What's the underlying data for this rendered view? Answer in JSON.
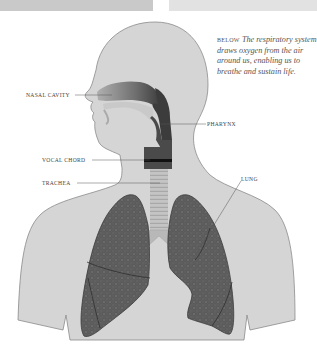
{
  "figure": {
    "title": "Respiratory system",
    "caption": {
      "lead": "BELOW",
      "body": "The respiratory system draws oxygen from the air around us, enabling us to breathe and sustain life."
    },
    "labels": {
      "nasal_cavity": "NASAL CAVITY",
      "pharynx": "PHARYNX",
      "vocal_chord": "VOCAL CHORD",
      "trachea": "TRACHEA",
      "lung": "LUNG"
    },
    "colors": {
      "body": "#d4d4d4",
      "outline": "#8a8a8a",
      "airway_dark": "#3a3a3a",
      "nasal_gradient_light": "#9a9a9a",
      "lung": "#5c5c5c",
      "trachea": "#bdbdbd",
      "topbar_left": "#c9c9c9",
      "topbar_right": "#e2e2e2"
    }
  }
}
